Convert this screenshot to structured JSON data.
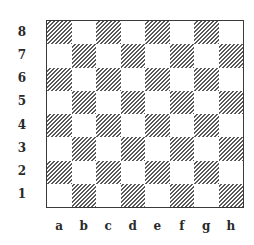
{
  "diagram": {
    "type": "chessboard",
    "orientation": "white-bottom",
    "ranks": [
      "8",
      "7",
      "6",
      "5",
      "4",
      "3",
      "2",
      "1"
    ],
    "files": [
      "a",
      "b",
      "c",
      "d",
      "e",
      "f",
      "g",
      "h"
    ],
    "pieces": [],
    "colors": {
      "light_square": "#ffffff",
      "dark_square_hatch": "#5a5a5a",
      "border": "#3a3a3a",
      "labels": "#2a2a2a"
    },
    "dark_square_style": "diagonal-hatch"
  }
}
